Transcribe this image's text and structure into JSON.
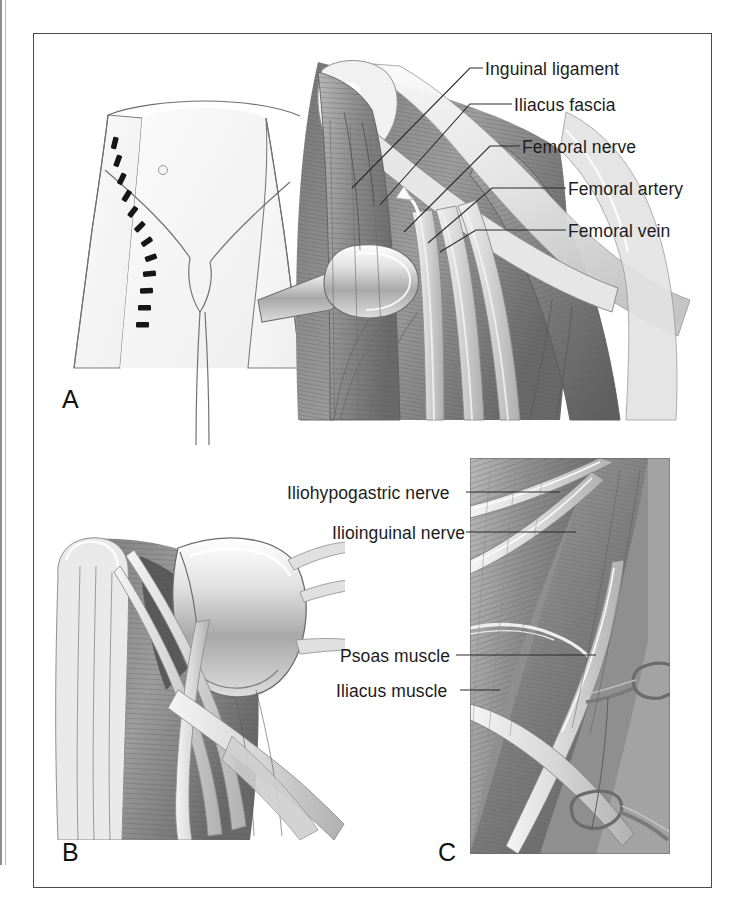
{
  "figure": {
    "kind": "surgical-anatomy-illustration",
    "region": "anterior pelvis and femoral triangle",
    "panels": [
      {
        "id": "A",
        "letter": "A",
        "description": "Oblique incision marked on anterior pelvis with exposed femoral triangle contents retracted",
        "labels": [
          "Inguinal ligament",
          "Iliacus fascia",
          "Femoral nerve",
          "Femoral artery",
          "Femoral vein"
        ]
      },
      {
        "id": "B",
        "letter": "B",
        "description": "Deeper exposure of psoas and iliacus with nerve trunks and retractor blade",
        "labels": []
      },
      {
        "id": "C",
        "letter": "C",
        "description": "Close-up inset of retroperitoneal plane showing nerves coursing over muscle with clamps",
        "labels": [
          "Iliohypogastric nerve",
          "Ilioinguinal nerve",
          "Psoas muscle",
          "Iliacus muscle"
        ]
      }
    ]
  },
  "panel_a": {
    "letter": "A",
    "labels": [
      {
        "id": "inguinal-ligament",
        "text": "Inguinal ligament"
      },
      {
        "id": "iliacus-fascia",
        "text": "Iliacus fascia"
      },
      {
        "id": "femoral-nerve",
        "text": "Femoral nerve"
      },
      {
        "id": "femoral-artery",
        "text": "Femoral artery"
      },
      {
        "id": "femoral-vein",
        "text": "Femoral vein"
      }
    ]
  },
  "panel_b": {
    "letter": "B",
    "labels": []
  },
  "panel_c": {
    "letter": "C",
    "labels": [
      {
        "id": "iliohypogastric-nerve",
        "text": "Iliohypogastric nerve"
      },
      {
        "id": "ilioinguinal-nerve",
        "text": "Ilioinguinal nerve"
      },
      {
        "id": "psoas-muscle",
        "text": "Psoas muscle"
      },
      {
        "id": "iliacus-muscle",
        "text": "Iliacus muscle"
      }
    ]
  },
  "colors": {
    "frame_border": "#4b4b4b",
    "label_text": "#1c1c1c",
    "leader_line": "#2b2b2b",
    "outline_light": "#8a8a8a",
    "muscle_dark": "#6f6f6f",
    "muscle_mid": "#9a9a9a",
    "muscle_light": "#c6c6c6",
    "vessel_pale": "#dcdcdc",
    "skin_tint": "#f2f2f2",
    "incision_mark": "#1a1a1a",
    "page_background": "#ffffff"
  }
}
